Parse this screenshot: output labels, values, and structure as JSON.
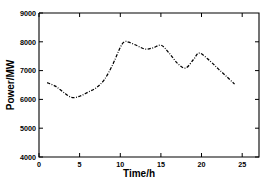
{
  "chart_data": {
    "type": "line",
    "title": "",
    "subtitle": "",
    "xlabel": "Time/h",
    "ylabel": "Power/MW",
    "xlim": [
      0,
      27
    ],
    "ylim": [
      4000,
      9000
    ],
    "xticks": [
      0,
      5,
      10,
      15,
      20,
      25
    ],
    "xtick_labels": [
      "0",
      "5",
      "10",
      "15",
      "20",
      "25"
    ],
    "yticks": [
      4000,
      5000,
      6000,
      7000,
      8000,
      9000
    ],
    "ytick_labels": [
      "4000",
      "5000",
      "6000",
      "7000",
      "8000",
      "9000"
    ],
    "grid": false,
    "legend": null,
    "legend_position": "none",
    "line_style": "dash-dot",
    "line_color": "#000000",
    "annotations": [],
    "series": [
      {
        "name": "Power",
        "x": [
          1,
          2,
          3,
          4,
          5,
          6,
          7,
          8,
          9,
          10,
          10.5,
          11,
          12,
          13,
          14,
          15,
          16,
          17,
          18,
          19,
          19.7,
          21,
          22,
          23,
          24
        ],
        "values": [
          6580,
          6460,
          6250,
          6070,
          6110,
          6250,
          6400,
          6680,
          7180,
          7820,
          8000,
          7990,
          7870,
          7750,
          7790,
          7880,
          7600,
          7250,
          7090,
          7400,
          7610,
          7330,
          7060,
          6800,
          6530
        ]
      }
    ]
  },
  "axes": {
    "x_axis_title": "Time/h",
    "y_axis_title": "Power/MW"
  }
}
